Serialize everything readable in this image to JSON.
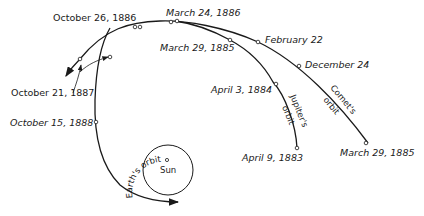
{
  "diagram": {
    "labels": {
      "oct_26_1886": "October 26, 1886",
      "mar_24_1886": "March 24, 1886",
      "mar_29_1885_top": "March 29, 1885",
      "feb_22": "February 22",
      "dec_24": "December 24",
      "apr_3_1884": "April 3, 1884",
      "oct_21_1887": "October 21, 1887",
      "oct_15_1888": "October 15, 1888",
      "apr_9_1883": "April 9, 1883",
      "mar_29_1885_bottom": "March 29, 1885",
      "jupiters_orbit_1": "Jupiter's",
      "jupiters_orbit_2": "orbit",
      "comets_orbit_1": "Comet's",
      "comets_orbit_2": "orbit",
      "earths_orbit": "Earth's orbit",
      "sun": "Sun"
    }
  }
}
